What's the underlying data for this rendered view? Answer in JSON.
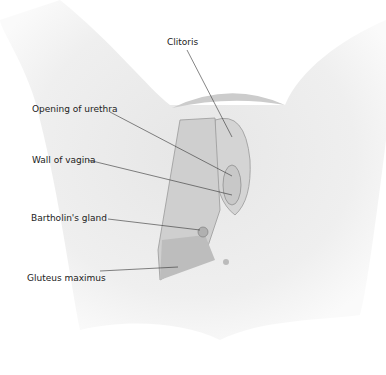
{
  "diagram": {
    "type": "anatomical-illustration",
    "style": "grayscale",
    "labels": [
      {
        "id": "clitoris",
        "text": "Clitoris",
        "x": 167,
        "y": 37,
        "line": [
          [
            187,
            50
          ],
          [
            232,
            137
          ]
        ]
      },
      {
        "id": "urethra",
        "text": "Opening of urethra",
        "x": 32,
        "y": 104,
        "line": [
          [
            110,
            112
          ],
          [
            232,
            176
          ]
        ]
      },
      {
        "id": "vagina",
        "text": "Wall of vagina",
        "x": 32,
        "y": 155,
        "line": [
          [
            88,
            160
          ],
          [
            232,
            195
          ]
        ]
      },
      {
        "id": "bartholin",
        "text": "Bartholin's gland",
        "x": 31,
        "y": 213,
        "line": [
          [
            108,
            219
          ],
          [
            200,
            230
          ]
        ]
      },
      {
        "id": "gluteus",
        "text": "Gluteus maximus",
        "x": 27,
        "y": 273,
        "line": [
          [
            100,
            271
          ],
          [
            178,
            267
          ]
        ]
      }
    ],
    "colors": {
      "skin_light": "#f0f0f0",
      "skin_mid": "#d8d8d8",
      "skin_dark": "#a8a8a8",
      "line": "#333333",
      "text": "#222222"
    }
  }
}
